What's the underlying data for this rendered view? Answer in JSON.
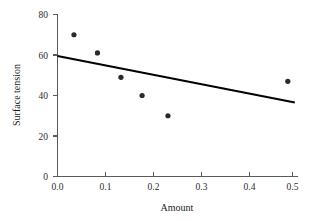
{
  "chart_data": {
    "type": "scatter",
    "title": "",
    "xlabel": "Amount",
    "ylabel": "Surface tension",
    "xlim": [
      0.0,
      0.52
    ],
    "ylim": [
      0,
      80
    ],
    "grid": false,
    "legend": null,
    "x_ticks": [
      0.0,
      0.1,
      0.2,
      0.3,
      0.4,
      0.5
    ],
    "x_tick_labels": [
      "0.0",
      "0.1",
      "0.2",
      "0.3",
      "0.4",
      "0.5"
    ],
    "y_ticks": [
      0,
      20,
      40,
      60,
      80
    ],
    "y_tick_labels": [
      "0",
      "20",
      "40",
      "60",
      "80"
    ],
    "points": [
      {
        "x": 0.035,
        "y": 70
      },
      {
        "x": 0.085,
        "y": 61
      },
      {
        "x": 0.135,
        "y": 49
      },
      {
        "x": 0.18,
        "y": 40
      },
      {
        "x": 0.235,
        "y": 30
      },
      {
        "x": 0.49,
        "y": 47
      }
    ],
    "series": [
      {
        "name": "Surface tension measurements",
        "x": [
          0.035,
          0.085,
          0.135,
          0.18,
          0.235,
          0.49
        ],
        "values": [
          70,
          61,
          49,
          40,
          30,
          47
        ]
      }
    ],
    "trend_line": {
      "type": "line",
      "name": "least-squares fit",
      "x": [
        0.0,
        0.505
      ],
      "values": [
        59.5,
        36.5
      ]
    },
    "colors": {
      "point": "#2a2a2a",
      "line": "#000000",
      "axis": "#5a5a5a",
      "text": "#1a1a1a",
      "background": "#ffffff"
    }
  },
  "axes": {
    "x_title": "Amount",
    "y_title": "Surface tension"
  }
}
